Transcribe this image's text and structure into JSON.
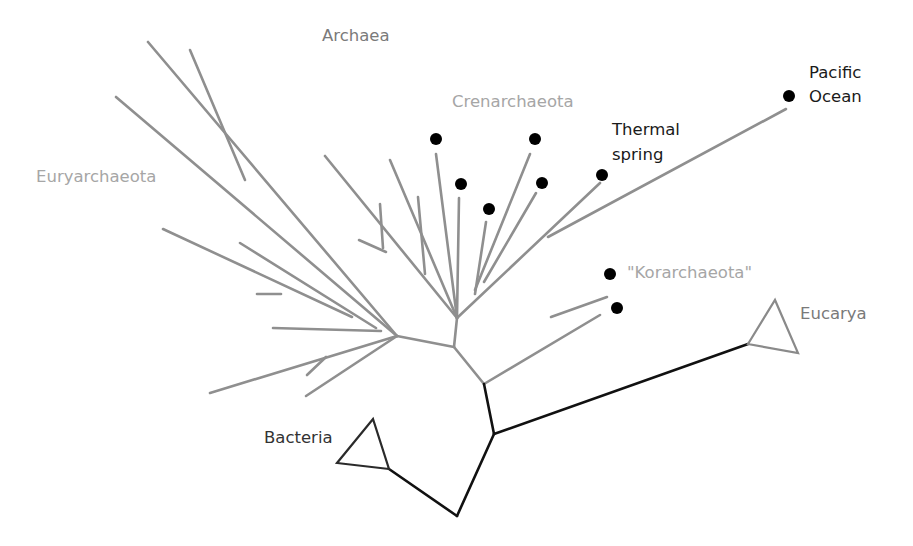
{
  "colors": {
    "archaea_branch": "#8f8f8f",
    "root_branch": "#111111",
    "group_label": "#a6a6a6",
    "domain_label_gray": "#7a7a7a",
    "domain_label_dark": "#333333",
    "site_label": "#1a1a1a",
    "dot": "#000000",
    "eucarya_triangle": "#8a8a8a",
    "bacteria_triangle": "#2a2a2a"
  },
  "labels": {
    "archaea": {
      "text": "Archaea",
      "x": 322,
      "y": 41
    },
    "euryarchaeota": {
      "text": "Euryarchaeota",
      "x": 36,
      "y": 182
    },
    "crenarchaeota": {
      "text": "Crenarchaeota",
      "x": 452,
      "y": 107
    },
    "korarchaeota": {
      "text": "\"Korarchaeota\"",
      "x": 627,
      "y": 278
    },
    "thermal_spring_1": {
      "text": "Thermal",
      "x": 612,
      "y": 135
    },
    "thermal_spring_2": {
      "text": "spring",
      "x": 612,
      "y": 160
    },
    "pacific_ocean_1": {
      "text": "Pacific",
      "x": 809,
      "y": 78
    },
    "pacific_ocean_2": {
      "text": "Ocean",
      "x": 809,
      "y": 102
    },
    "eucarya": {
      "text": "Eucarya",
      "x": 800,
      "y": 319
    },
    "bacteria": {
      "text": "Bacteria",
      "x": 264,
      "y": 443
    }
  },
  "root_tree": [
    [
      484,
      384,
      494,
      434
    ],
    [
      494,
      434,
      748,
      344
    ],
    [
      494,
      434,
      457,
      516
    ],
    [
      457,
      516,
      389,
      469
    ]
  ],
  "triangles": {
    "eucarya": {
      "points": "748,344 775,300 798,353"
    },
    "bacteria": {
      "points": "389,469 337,463 373,419"
    }
  },
  "archaea_tree": [
    [
      484,
      384,
      454,
      347
    ],
    [
      484,
      384,
      600,
      315
    ],
    [
      551,
      317,
      607,
      297
    ],
    [
      454,
      347,
      457,
      318
    ],
    [
      457,
      318,
      325,
      156
    ],
    [
      383,
      248,
      380,
      204
    ],
    [
      386,
      252,
      359,
      240
    ],
    [
      457,
      318,
      390,
      160
    ],
    [
      425,
      274,
      418,
      197
    ],
    [
      457,
      318,
      436,
      154
    ],
    [
      457,
      318,
      459,
      198
    ],
    [
      457,
      318,
      600,
      183
    ],
    [
      475,
      294,
      486,
      222
    ],
    [
      475,
      290,
      530,
      154
    ],
    [
      484,
      282,
      536,
      193
    ],
    [
      548,
      237,
      786,
      109
    ],
    [
      454,
      347,
      397,
      336
    ],
    [
      397,
      336,
      148,
      42
    ],
    [
      245,
      180,
      190,
      50
    ],
    [
      397,
      336,
      116,
      97
    ],
    [
      376,
      328,
      240,
      243
    ],
    [
      352,
      317,
      163,
      229
    ],
    [
      281,
      294,
      257,
      294
    ],
    [
      381,
      331,
      273,
      328
    ],
    [
      397,
      336,
      210,
      393
    ],
    [
      326,
      357,
      307,
      375
    ],
    [
      397,
      336,
      306,
      396
    ]
  ],
  "dots": [
    {
      "x": 436,
      "y": 139
    },
    {
      "x": 535,
      "y": 139
    },
    {
      "x": 461,
      "y": 184
    },
    {
      "x": 542,
      "y": 183
    },
    {
      "x": 489,
      "y": 209
    },
    {
      "x": 602,
      "y": 175
    },
    {
      "x": 789,
      "y": 96
    },
    {
      "x": 610,
      "y": 274
    },
    {
      "x": 617,
      "y": 308
    }
  ]
}
